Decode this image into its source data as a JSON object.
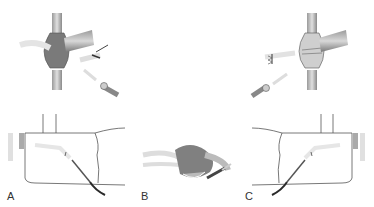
{
  "figure": {
    "panels": [
      {
        "label": "A",
        "description": "Left-side approach: clavicle-like bone with sheath, needle insertion from lower right"
      },
      {
        "label": "B",
        "description": "Central cross-section: mass with needle/catheter entering from right"
      },
      {
        "label": "C",
        "description": "Right-side approach: mirrored view with needle insertion from lower left"
      }
    ]
  },
  "colors": {
    "bone_dark": "#6e6e6e",
    "bone_light": "#b8b8b8",
    "outline": "#555555",
    "faint": "#d8d8d8",
    "needle_dark": "#2a2a2a"
  }
}
